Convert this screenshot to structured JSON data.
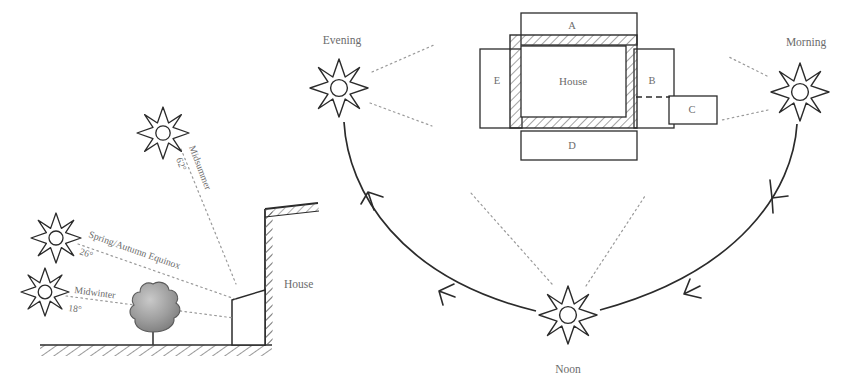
{
  "diagram": {
    "colors": {
      "ink": "#2b2b2b",
      "label_gray": "#6b6b6b",
      "hatch_gray": "#8a8a8a",
      "tree_fill": "#9a9a9a",
      "dotted_ray": "#9a9a9a",
      "background": "#ffffff"
    }
  },
  "section_view": {
    "name": "seasonal-sun-angle-section",
    "house_label": "House",
    "sun_paths": [
      {
        "id": "midsummer",
        "season_label": "Midsummer",
        "angle_label": "62°",
        "angle_value": 62,
        "sun": {
          "cx": 163,
          "cy": 133
        },
        "ray_end": {
          "x": 235,
          "y": 285
        }
      },
      {
        "id": "equinox",
        "season_label": "Spring/Autumn Equinox",
        "angle_label": "26°",
        "angle_value": 26,
        "sun": {
          "cx": 56,
          "cy": 238
        },
        "ray_end": {
          "x": 236,
          "y": 300
        }
      },
      {
        "id": "midwinter",
        "season_label": "Midwinter",
        "angle_label": "18°",
        "angle_value": 18,
        "sun": {
          "cx": 45,
          "cy": 292
        },
        "ray_end": {
          "x": 232,
          "y": 318
        }
      }
    ],
    "tree": {
      "name": "deciduous-tree",
      "cx": 153,
      "cy": 312
    },
    "ground": {
      "name": "ground-line",
      "x1": 40,
      "x2": 272,
      "y": 345
    }
  },
  "plan_view": {
    "name": "house-plan-zones",
    "house_label": "House",
    "zones": [
      {
        "id": "A",
        "label": "A",
        "position": "north"
      },
      {
        "id": "B",
        "label": "B",
        "position": "east"
      },
      {
        "id": "C",
        "label": "C",
        "position": "east-outer"
      },
      {
        "id": "D",
        "label": "D",
        "position": "south"
      },
      {
        "id": "E",
        "label": "E",
        "position": "west"
      }
    ]
  },
  "sun_path_arc": {
    "name": "daily-sun-path",
    "direction": "morning-to-noon-to-evening",
    "positions": [
      {
        "id": "morning",
        "label": "Morning",
        "sun": {
          "cx": 800,
          "cy": 92
        },
        "label_xy": {
          "x": 806,
          "y": 46
        }
      },
      {
        "id": "noon",
        "label": "Noon",
        "sun": {
          "cx": 568,
          "cy": 315
        },
        "label_xy": {
          "x": 568,
          "y": 371
        }
      },
      {
        "id": "evening",
        "label": "Evening",
        "sun": {
          "cx": 339,
          "cy": 88
        },
        "label_xy": {
          "x": 342,
          "y": 41
        }
      }
    ],
    "arrow_count": 4
  }
}
